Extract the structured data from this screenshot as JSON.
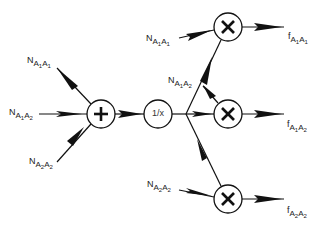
{
  "diagram": {
    "type": "signal-flow",
    "nodes": {
      "sum": {
        "symbol": "+",
        "role": "adder"
      },
      "reciprocal": {
        "symbol": "1/x",
        "role": "reciprocal"
      },
      "mult1": {
        "symbol": "×",
        "role": "multiplier"
      },
      "mult2": {
        "symbol": "×",
        "role": "multiplier"
      },
      "mult3": {
        "symbol": "×",
        "role": "multiplier"
      }
    },
    "inputs": [
      {
        "id": "in_a1a1",
        "base": "N",
        "sub1": "A",
        "idx1": "1",
        "sub2": "A",
        "idx2": "1",
        "target": "sum"
      },
      {
        "id": "in_a1a2",
        "base": "N",
        "sub1": "A",
        "idx1": "1",
        "sub2": "A",
        "idx2": "2",
        "target": "sum"
      },
      {
        "id": "in_a2a2",
        "base": "N",
        "sub1": "A",
        "idx1": "2",
        "sub2": "A",
        "idx2": "2",
        "target": "sum"
      },
      {
        "id": "mul_a1a1",
        "base": "N",
        "sub1": "A",
        "idx1": "1",
        "sub2": "A",
        "idx2": "1",
        "target": "mult1"
      },
      {
        "id": "mul_a1a2",
        "base": "N",
        "sub1": "A",
        "idx1": "1",
        "sub2": "A",
        "idx2": "2",
        "target": "mult2"
      },
      {
        "id": "mul_a2a2",
        "base": "N",
        "sub1": "A",
        "idx1": "2",
        "sub2": "A",
        "idx2": "2",
        "target": "mult3"
      }
    ],
    "outputs": [
      {
        "id": "out_a1a1",
        "base": "f",
        "sub1": "A",
        "idx1": "1",
        "sub2": "A",
        "idx2": "1",
        "source": "mult1"
      },
      {
        "id": "out_a1a2",
        "base": "f",
        "sub1": "A",
        "idx1": "1",
        "sub2": "A",
        "idx2": "2",
        "source": "mult2"
      },
      {
        "id": "out_a2a2",
        "base": "f",
        "sub1": "A",
        "idx1": "2",
        "sub2": "A",
        "idx2": "2",
        "source": "mult3"
      }
    ],
    "colors": {
      "line": "#111111",
      "text": "#222222",
      "background": "#ffffff"
    }
  }
}
